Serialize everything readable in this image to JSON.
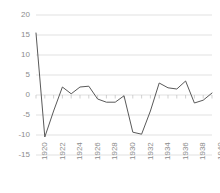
{
  "chart_data": {
    "type": "line",
    "title": "",
    "subtitle": "",
    "xlabel": "",
    "ylabel": "",
    "legend": [],
    "legend_position": "none",
    "grid": true,
    "grid_axis": "y",
    "ylim": [
      -15,
      20
    ],
    "yticks": [
      20,
      15,
      10,
      5,
      0,
      -5,
      -10,
      -15
    ],
    "ytick_labels": [
      "20",
      "15",
      "10",
      "5",
      "0",
      "-5",
      "-10",
      "-15"
    ],
    "xlim": [
      1920,
      1940
    ],
    "xticks": [
      1920,
      1922,
      1924,
      1926,
      1928,
      1930,
      1932,
      1934,
      1936,
      1938,
      1940
    ],
    "xtick_labels": [
      "1920",
      "1922",
      "1924",
      "1926",
      "1928",
      "1930",
      "1932",
      "1934",
      "1936",
      "1938",
      "1940"
    ],
    "xtick_rotation": -90,
    "x": [
      1920,
      1921,
      1922,
      1923,
      1924,
      1925,
      1926,
      1927,
      1928,
      1929,
      1930,
      1931,
      1932,
      1933,
      1934,
      1935,
      1936,
      1937,
      1938,
      1939,
      1940
    ],
    "values": [
      15.5,
      -10.5,
      -4.0,
      2.0,
      0.3,
      2.0,
      2.2,
      -1.0,
      -1.8,
      -1.8,
      -0.2,
      -9.3,
      -9.8,
      -4.0,
      3.0,
      1.8,
      1.5,
      3.5,
      -2.0,
      -1.3,
      0.5
    ],
    "series": [
      {
        "name": "series-1",
        "values": [
          15.5,
          -10.5,
          -4.0,
          2.0,
          0.3,
          2.0,
          2.2,
          -1.0,
          -1.8,
          -1.8,
          -0.2,
          -9.3,
          -9.8,
          -4.0,
          3.0,
          1.8,
          1.5,
          3.5,
          -2.0,
          -1.3,
          0.5
        ],
        "color": "#595959",
        "line_width": 1
      }
    ],
    "colors": {
      "line": "#595959",
      "grid": "#d9d9d9",
      "axis_text": "#8c8c8c",
      "background": "#ffffff",
      "zero_axis": "#bfbfbf"
    }
  }
}
